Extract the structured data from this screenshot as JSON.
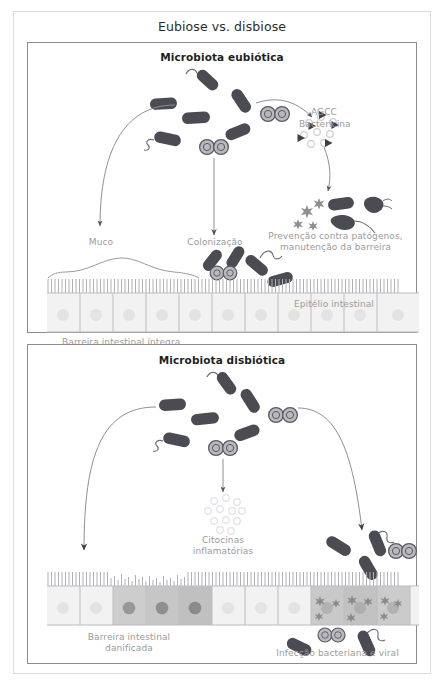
{
  "figure": {
    "title": "Eubiose vs. disbiose",
    "type": "biological-schematic-diagram",
    "language": "pt-BR"
  },
  "panels": [
    {
      "id": "eubiosis",
      "title": "Microbiota eubiótica",
      "labels": {
        "scfa": "AGCC",
        "bacteriocin": "Bactericina",
        "pathogen_prevention_line1": "Prevenção contra patógenos,",
        "pathogen_prevention_line2": "manutenção da barreira",
        "mucus": "Muco",
        "colonization": "Colonização",
        "epithelium": "Epitélio intestinal",
        "barrier": "Barreira intestinal íntegra"
      }
    },
    {
      "id": "dysbiosis",
      "title": "Microbiota disbiótica",
      "labels": {
        "cytokines_line1": "Citocinas",
        "cytokines_line2": "inflamatórias",
        "barrier_line1": "Barreira intestinal",
        "barrier_line2": "danificada",
        "infection": "Infecção bacteriana e viral"
      }
    }
  ],
  "icons": {
    "rod_bacterium": "rod-bacterium-icon",
    "flagellated_bacterium": "flagellated-bacterium-icon",
    "diplococcus": "diplococcus-icon",
    "virus": "virus-star-icon",
    "bacteriocin": "bacteriocin-triangle-icon",
    "scfa": "scfa-circle-icon",
    "cytokine": "cytokine-circle-icon",
    "dead_bacterium": "dead-bacterium-icon",
    "arrow": "arrow-icon",
    "mucus_layer": "mucus-layer-icon",
    "microvilli": "microvilli-icon",
    "epithelial_cell": "epithelial-cell-icon"
  },
  "colors": {
    "bacteria_dark": "#4b4b53",
    "bacteria_mid": "#5c5c64",
    "cell_healthy": "#f2f2f2",
    "cell_damaged": "#c9c9c9",
    "nucleus_healthy": "#e2e2e2",
    "nucleus_damaged": "#9a9a9a",
    "outline": "#9a9a9a",
    "label_text": "#9b9b9b",
    "title_text": "#1f1f1f",
    "frame": "#8d8d8d",
    "virus": "#8f8f8f",
    "scfa_light": "#e8e8e8"
  },
  "diagram_content": {
    "eubiosis_flow": [
      "Microbiota eubiótica produces AGCC and Bactericina",
      "Leads to prevention against pathogens and barrier maintenance",
      "Mucus layer present over intact epithelium",
      "Healthy colonization on epithelial surface",
      "Barreira intestinal íntegra"
    ],
    "dysbiosis_flow": [
      "Microbiota disbiótica produces inflammatory cytokines",
      "Bacteria invade epithelium",
      "Barrier damaged, microvilli shortened, cells darkened",
      "Bacterial and viral infection crosses barrier"
    ]
  }
}
